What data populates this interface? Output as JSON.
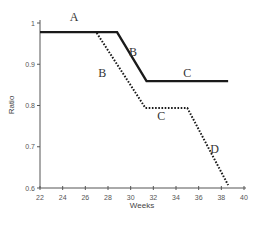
{
  "chart_data": {
    "type": "line",
    "title": "",
    "xlabel": "Weeks",
    "ylabel": "Ratio",
    "xlim": [
      22,
      40
    ],
    "ylim": [
      0.6,
      1.0
    ],
    "grid": false,
    "legend": null,
    "x_ticks": [
      22,
      24,
      26,
      28,
      30,
      32,
      34,
      36,
      38,
      40
    ],
    "y_ticks": [
      0.6,
      0.7,
      0.8,
      0.9,
      1
    ],
    "series": [
      {
        "name": "solid",
        "style": "solid",
        "x": [
          22,
          28.8,
          31.4,
          38.6
        ],
        "y": [
          0.978,
          0.978,
          0.859,
          0.859
        ]
      },
      {
        "name": "dotted",
        "style": "dotted",
        "x": [
          27.0,
          31.3,
          35.0,
          38.6
        ],
        "y": [
          0.976,
          0.794,
          0.794,
          0.607
        ]
      }
    ],
    "annotations": [
      {
        "text": "A",
        "x": 25.0,
        "y": 1.005
      },
      {
        "text": "B",
        "x": 30.2,
        "y": 0.92
      },
      {
        "text": "C",
        "x": 35.0,
        "y": 0.87
      },
      {
        "text": "B",
        "x": 27.5,
        "y": 0.87
      },
      {
        "text": "C",
        "x": 32.7,
        "y": 0.765
      },
      {
        "text": "D",
        "x": 37.4,
        "y": 0.685
      }
    ]
  }
}
